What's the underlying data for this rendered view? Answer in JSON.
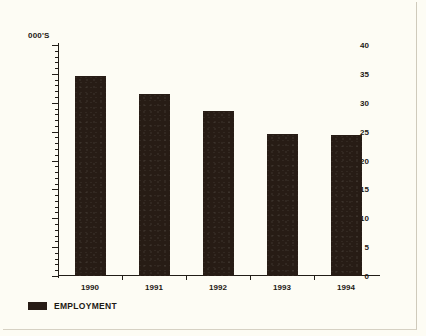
{
  "chart_data": {
    "type": "bar",
    "title": "",
    "subtitle": "",
    "unit_label": "000'S",
    "xlabel": "",
    "ylabel": "",
    "categories": [
      "1990",
      "1991",
      "1992",
      "1993",
      "1994"
    ],
    "series": [
      {
        "name": "EMPLOYMENT",
        "color": "#271c15",
        "values": [
          34.7,
          31.5,
          28.5,
          24.6,
          24.5
        ]
      }
    ],
    "ylim": [
      0,
      40
    ],
    "ytick_step": 5,
    "yminor_step": 1,
    "ytick_labels": [
      "0",
      "5",
      "10",
      "15",
      "20",
      "25",
      "30",
      "35",
      "40"
    ],
    "grid": false,
    "legend_position": "bottom-left",
    "legend": [
      {
        "label": "EMPLOYMENT",
        "color": "#271c15"
      }
    ]
  },
  "colors": {
    "background": "#fdfcf4",
    "ink": "#1d1a14",
    "bar": "#271c15"
  }
}
